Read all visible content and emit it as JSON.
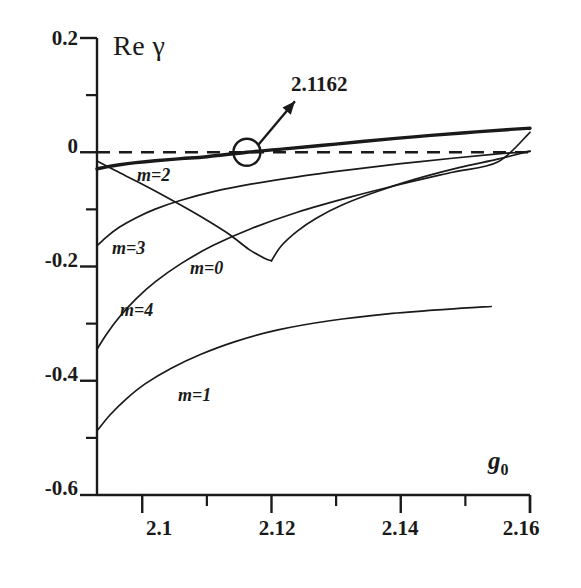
{
  "chart_data": {
    "type": "line",
    "title": "",
    "xlabel": "g0",
    "ylabel": "Re gamma",
    "xlim": [
      2.093,
      2.16
    ],
    "ylim": [
      -0.6,
      0.2
    ],
    "grid": false,
    "legend_position": "inline-curve-labels",
    "x_ticks_major": [
      "2.1",
      "2.12",
      "2.14",
      "2.16"
    ],
    "x_ticks_major_values": [
      2.1,
      2.12,
      2.14,
      2.16
    ],
    "x_ticks_minor_values": [
      2.11,
      2.13,
      2.15
    ],
    "y_ticks_major": [
      "0.2",
      "0",
      "-0.2",
      "-0.4",
      "-0.6"
    ],
    "y_ticks_major_values": [
      0.2,
      0.0,
      -0.2,
      -0.4,
      -0.6
    ],
    "y_ticks_minor_values": [
      0.1,
      -0.1,
      -0.3,
      -0.5
    ],
    "zero_line": {
      "value": 0.0,
      "style": "dashed"
    },
    "annotations": [
      {
        "text": "2.1162",
        "marker": "circle",
        "marker_x": 2.1162,
        "marker_y": 0.0,
        "note": "zero crossing of m=2 branch"
      }
    ],
    "series": [
      {
        "name": "m=2",
        "label": "m=2",
        "linewidth": "thick",
        "points": [
          [
            2.093,
            -0.029
          ],
          [
            2.0945,
            -0.0255
          ],
          [
            2.0965,
            -0.0218
          ],
          [
            2.099,
            -0.0182
          ],
          [
            2.102,
            -0.0148
          ],
          [
            2.106,
            -0.0112
          ],
          [
            2.11,
            -0.0078
          ],
          [
            2.1162,
            0.0
          ],
          [
            2.122,
            0.006
          ],
          [
            2.128,
            0.0122
          ],
          [
            2.134,
            0.0188
          ],
          [
            2.142,
            0.027
          ],
          [
            2.15,
            0.0342
          ],
          [
            2.157,
            0.04
          ],
          [
            2.16,
            0.042
          ]
        ]
      },
      {
        "name": "m=3",
        "label": "m=3",
        "linewidth": "thin",
        "points": [
          [
            2.093,
            -0.164
          ],
          [
            2.0945,
            -0.148
          ],
          [
            2.0965,
            -0.131
          ],
          [
            2.099,
            -0.115
          ],
          [
            2.102,
            -0.0995
          ],
          [
            2.106,
            -0.084
          ],
          [
            2.111,
            -0.069
          ],
          [
            2.117,
            -0.0555
          ],
          [
            2.124,
            -0.043
          ],
          [
            2.132,
            -0.031
          ],
          [
            2.14,
            -0.02
          ],
          [
            2.148,
            -0.0105
          ],
          [
            2.155,
            -0.003
          ],
          [
            2.16,
            0.0015
          ]
        ]
      },
      {
        "name": "m=0",
        "label": "m=0",
        "linewidth": "thin",
        "note": "descending branch from upper-left meeting cusp then rising",
        "points": [
          [
            2.093,
            -0.0155
          ],
          [
            2.096,
            -0.033
          ],
          [
            2.0995,
            -0.053
          ],
          [
            2.103,
            -0.074
          ],
          [
            2.1065,
            -0.096
          ],
          [
            2.11,
            -0.119
          ],
          [
            2.1135,
            -0.144
          ],
          [
            2.1165,
            -0.17
          ],
          [
            2.119,
            -0.186
          ],
          [
            2.12,
            -0.19
          ],
          [
            2.1215,
            -0.164
          ],
          [
            2.124,
            -0.138
          ],
          [
            2.127,
            -0.115
          ],
          [
            2.131,
            -0.092
          ],
          [
            2.136,
            -0.07
          ],
          [
            2.142,
            -0.048
          ],
          [
            2.149,
            -0.027
          ],
          [
            2.155,
            -0.012
          ],
          [
            2.16,
            0.002
          ]
        ]
      },
      {
        "name": "m=4",
        "label": "m=4",
        "linewidth": "thin",
        "points": [
          [
            2.093,
            -0.345
          ],
          [
            2.0945,
            -0.318
          ],
          [
            2.0965,
            -0.288
          ],
          [
            2.099,
            -0.257
          ],
          [
            2.102,
            -0.227
          ],
          [
            2.106,
            -0.195
          ],
          [
            2.111,
            -0.163
          ],
          [
            2.117,
            -0.133
          ],
          [
            2.124,
            -0.105
          ],
          [
            2.132,
            -0.079
          ],
          [
            2.14,
            -0.056
          ],
          [
            2.148,
            -0.035
          ],
          [
            2.155,
            -0.017
          ],
          [
            2.16,
            0.035
          ]
        ]
      },
      {
        "name": "m=1",
        "label": "m=1",
        "linewidth": "thin",
        "points": [
          [
            2.093,
            -0.488
          ],
          [
            2.095,
            -0.46
          ],
          [
            2.0975,
            -0.432
          ],
          [
            2.1005,
            -0.405
          ],
          [
            2.1045,
            -0.378
          ],
          [
            2.109,
            -0.354
          ],
          [
            2.1145,
            -0.331
          ],
          [
            2.121,
            -0.311
          ],
          [
            2.129,
            -0.295
          ],
          [
            2.138,
            -0.283
          ],
          [
            2.147,
            -0.275
          ],
          [
            2.154,
            -0.27
          ]
        ]
      }
    ]
  },
  "axes": {
    "y_title_prefix": "Re",
    "y_title_symbol": "γ",
    "x_title_base": "g",
    "x_title_sub": "0"
  }
}
